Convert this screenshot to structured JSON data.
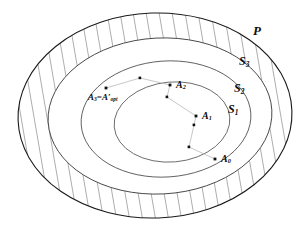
{
  "figure": {
    "kind": "nested-ellipse-set-diagram",
    "width": 306,
    "height": 230,
    "background_color": "#ffffff",
    "stroke_color": "#1a1a1a",
    "hatch_color": "#8a8a8a",
    "point_color": "#111111",
    "path_color": "#b9b9b9"
  },
  "set_labels": [
    {
      "id": "P",
      "base": "P",
      "subscript": "",
      "x": 253,
      "y": 24
    },
    {
      "id": "S3",
      "base": "S",
      "subscript": "3",
      "x": 239,
      "y": 55
    },
    {
      "id": "S2",
      "base": "S",
      "subscript": "2",
      "x": 234,
      "y": 82
    },
    {
      "id": "S1",
      "base": "S",
      "subscript": "1",
      "x": 228,
      "y": 103
    }
  ],
  "point_labels": [
    {
      "id": "A3opt",
      "text_a": "A",
      "sub_a": "3",
      "eq": "=",
      "text_b": "A",
      "prime": "′",
      "sub_b": "opt",
      "x": 88,
      "y": 93
    },
    {
      "id": "A2",
      "base": "A",
      "subscript": "2",
      "x": 176,
      "y": 80
    },
    {
      "id": "A1",
      "base": "A",
      "subscript": "1",
      "x": 202,
      "y": 111
    },
    {
      "id": "A0",
      "base": "A",
      "subscript": "0",
      "x": 221,
      "y": 154
    }
  ],
  "ellipses": [
    {
      "id": "P",
      "cx": 155,
      "cy": 115.5,
      "rx": 137,
      "ry": 102.5,
      "rot": -2,
      "hatched_outer": true
    },
    {
      "id": "S3",
      "cx": 160,
      "cy": 116,
      "rx": 112,
      "ry": 78,
      "rot": -3,
      "hatched_outer": false
    },
    {
      "id": "S2",
      "cx": 166,
      "cy": 119,
      "rx": 85,
      "ry": 58,
      "rot": -4,
      "hatched_outer": false
    },
    {
      "id": "S1",
      "cx": 172,
      "cy": 122,
      "rx": 58,
      "ry": 40,
      "rot": -5,
      "hatched_outer": false
    }
  ],
  "points": [
    {
      "id": "p-A3",
      "x": 106,
      "y": 88,
      "label": "A3opt"
    },
    {
      "id": "p-v1",
      "x": 140,
      "y": 78,
      "label": ""
    },
    {
      "id": "p-A2",
      "x": 170,
      "y": 85,
      "label": "A2"
    },
    {
      "id": "p-v2",
      "x": 167,
      "y": 97,
      "label": ""
    },
    {
      "id": "p-A1",
      "x": 196,
      "y": 116,
      "label": "A1"
    },
    {
      "id": "p-v3",
      "x": 194,
      "y": 125,
      "label": ""
    },
    {
      "id": "p-v4",
      "x": 189,
      "y": 147,
      "label": ""
    },
    {
      "id": "p-A0",
      "x": 215,
      "y": 159,
      "label": "A0"
    }
  ],
  "path_segments": [
    {
      "from": "p-A0",
      "to": "p-v4"
    },
    {
      "from": "p-v4",
      "to": "p-v3"
    },
    {
      "from": "p-v3",
      "to": "p-A1"
    },
    {
      "from": "p-A1",
      "to": "p-v2"
    },
    {
      "from": "p-v2",
      "to": "p-A2"
    },
    {
      "from": "p-A2",
      "to": "p-v1"
    },
    {
      "from": "p-v1",
      "to": "p-A3"
    }
  ]
}
